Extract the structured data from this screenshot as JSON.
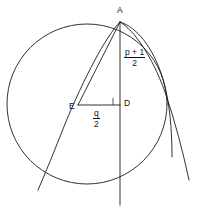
{
  "figure": {
    "kind": "geometry-diagram",
    "stroke_color": "#1c1c1c",
    "background_color": "#ffffff",
    "points": [
      {
        "id": "A",
        "label": "A",
        "x": 120,
        "y": 22,
        "label_x": 117,
        "label_y": 7
      },
      {
        "id": "D",
        "label": "D",
        "x": 120,
        "y": 103,
        "label_x": 124,
        "label_y": 98
      },
      {
        "id": "E",
        "label": "E",
        "x": 78,
        "y": 106,
        "label_x": 70,
        "label_y": 102
      }
    ],
    "labels": [
      {
        "id": "vertical-segment-label",
        "name": "segment-AD-length",
        "numerator": "p + 1",
        "denominator": "2",
        "x": 126,
        "y": 50
      },
      {
        "id": "horizontal-segment-label",
        "name": "segment-ED-length",
        "numerator": "q",
        "denominator": "2",
        "x": 94,
        "y": 110
      }
    ],
    "circle": {
      "center_x": 87,
      "center_y": 104,
      "radius": 80
    },
    "right_angle_marker_at": "D"
  }
}
